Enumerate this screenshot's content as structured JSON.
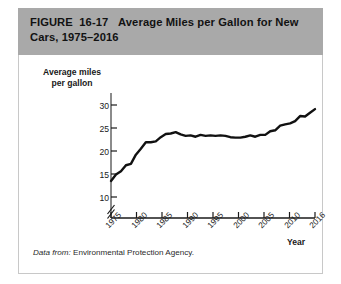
{
  "figure": {
    "number": "FIGURE  16-17",
    "title": "Average Miles per Gallon for New Cars, 1975–2016",
    "header_full": "FIGURE  16-17   Average Miles per Gallon for New Cars, 1975–2016",
    "source_lead": "Data from:",
    "source_text": " Environmental Protection Agency.",
    "header_bg": "#a9a9a9",
    "panel_bg": "#ffffff",
    "line_color": "#111111"
  },
  "chart_data": {
    "type": "line",
    "title": "Average Miles per Gallon for New Cars, 1975–2016",
    "xlabel": "Year",
    "ylabel": "Average miles per gallon",
    "ylabel_line1": "Average miles",
    "ylabel_line2": "per gallon",
    "xlim": [
      1975,
      2016
    ],
    "ylim": [
      9,
      31
    ],
    "y_axis_break": true,
    "grid": false,
    "legend": "none",
    "y_ticks": [
      10,
      15,
      20,
      25,
      30
    ],
    "x_ticks": [
      1975,
      1980,
      1985,
      1990,
      1995,
      2000,
      2005,
      2010,
      2016
    ],
    "x_tick_rotation": -45,
    "series": [
      {
        "name": "Average miles per gallon",
        "color": "#111111",
        "x": [
          1975,
          1976,
          1977,
          1978,
          1979,
          1980,
          1981,
          1982,
          1983,
          1984,
          1985,
          1986,
          1987,
          1988,
          1989,
          1990,
          1991,
          1992,
          1993,
          1994,
          1995,
          1996,
          1997,
          1998,
          1999,
          2000,
          2001,
          2002,
          2003,
          2004,
          2005,
          2006,
          2007,
          2008,
          2009,
          2010,
          2011,
          2012,
          2013,
          2014,
          2015,
          2016
        ],
        "values": [
          13.5,
          14.9,
          15.6,
          16.9,
          17.2,
          19.2,
          20.5,
          21.9,
          21.9,
          22.1,
          23.0,
          23.7,
          23.8,
          24.1,
          23.6,
          23.3,
          23.4,
          23.1,
          23.5,
          23.3,
          23.4,
          23.3,
          23.4,
          23.3,
          23.0,
          22.9,
          22.9,
          23.1,
          23.4,
          23.1,
          23.5,
          23.5,
          24.3,
          24.5,
          25.5,
          25.8,
          26.0,
          26.5,
          27.6,
          27.5,
          28.3,
          29.1
        ]
      }
    ]
  },
  "axis_labels": {
    "y": [
      "30",
      "25",
      "20",
      "15",
      "10"
    ],
    "x": [
      "1975",
      "1980",
      "1985",
      "1990",
      "1995",
      "2000",
      "2005",
      "2010",
      "2016"
    ]
  }
}
